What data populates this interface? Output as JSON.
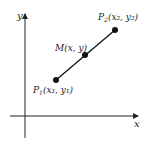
{
  "diagram": {
    "axes": {
      "x_label": "x",
      "y_label": "y"
    },
    "points": [
      {
        "id": "P1",
        "label_main": "P",
        "label_sub": "1",
        "coords": "(x₁, y₁)",
        "text": "P1(x1, y1)"
      },
      {
        "id": "M",
        "label_main": "M",
        "label_sub": "",
        "coords": "(x, y)",
        "text": "M(x, y)"
      },
      {
        "id": "P2",
        "label_main": "P",
        "label_sub": "2",
        "coords": "(x₂, y₂)",
        "text": "P2(x2, y2)"
      }
    ],
    "colors": {
      "line": "#111111",
      "point": "#111111",
      "axis": "#222222"
    }
  }
}
